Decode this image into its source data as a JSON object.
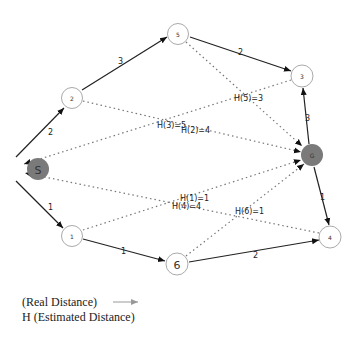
{
  "nodes": {
    "S": {
      "label": "S",
      "x": 11,
      "y": 169,
      "filled": true
    },
    "n2": {
      "label": "2",
      "x": 72,
      "y": 98,
      "filled": false
    },
    "n5": {
      "label": "5",
      "x": 178,
      "y": 34,
      "filled": false
    },
    "n3": {
      "label": "3",
      "x": 302,
      "y": 76,
      "filled": false
    },
    "G": {
      "label": "G",
      "x": 312,
      "y": 155,
      "filled": true
    },
    "n4": {
      "label": "4",
      "x": 330,
      "y": 237,
      "filled": false
    },
    "n1": {
      "label": "1",
      "x": 72,
      "y": 236,
      "filled": false
    },
    "n6": {
      "label": "6",
      "x": 177,
      "y": 264,
      "filled": false
    }
  },
  "edges": [
    {
      "from": "S",
      "to": "n2",
      "weight": "2"
    },
    {
      "from": "n2",
      "to": "n5",
      "weight": "3"
    },
    {
      "from": "n5",
      "to": "n3",
      "weight": "2"
    },
    {
      "from": "G",
      "to": "n3",
      "weight": "3"
    },
    {
      "from": "G",
      "to": "n4",
      "weight": "1"
    },
    {
      "from": "S",
      "to": "n1",
      "weight": "1"
    },
    {
      "from": "n1",
      "to": "n6",
      "weight": "1"
    },
    {
      "from": "n6",
      "to": "n4",
      "weight": "2"
    }
  ],
  "heuristics": [
    {
      "label": "H(3)=5",
      "x": 157,
      "y": 125
    },
    {
      "label": "H(2)=4",
      "x": 181,
      "y": 131
    },
    {
      "label": "H(5)=3",
      "x": 234,
      "y": 98
    },
    {
      "label": "H(1)=1",
      "x": 180,
      "y": 200
    },
    {
      "label": "H(4)=4",
      "x": 172,
      "y": 208
    },
    {
      "label": "H(6)=1",
      "x": 235,
      "y": 213
    }
  ],
  "legend": {
    "real_distance": "(Real Distance)",
    "estimated_distance": "H (Estimated Distance)"
  }
}
